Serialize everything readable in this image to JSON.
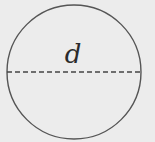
{
  "diagram": {
    "type": "circle-with-diameter",
    "background": "#ececec",
    "stroke_color": "#555555",
    "circle": {
      "cx": 74,
      "cy": 72,
      "r": 67
    },
    "diameter": {
      "x1": 7,
      "y1": 72,
      "x2": 141,
      "y2": 72,
      "style": "dashed"
    },
    "label": "d"
  }
}
